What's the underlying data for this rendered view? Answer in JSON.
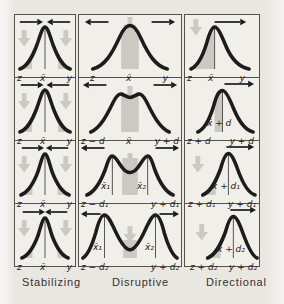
{
  "figure": {
    "title_hidden": "",
    "colors": {
      "curve": "#1c1c1c",
      "gray_region": "#cbc9c2",
      "background": "#e9e7e2",
      "panel_background": "#f1efea",
      "border": "#565349"
    },
    "columns": [
      {
        "caption": "Stabilizing",
        "rows": [
          {
            "left": "z",
            "mid": "x̄",
            "right": "y"
          },
          {
            "left": "z",
            "mid": "x̄",
            "right": "y"
          },
          {
            "left": "z",
            "mid": "x̄",
            "right": "y"
          },
          {
            "left": "z",
            "mid": "x̄",
            "right": "y"
          }
        ]
      },
      {
        "caption": "Disruptive",
        "rows": [
          {
            "left": "z",
            "mid": "x̄",
            "right": "y"
          },
          {
            "left": "z − d",
            "mid": "x̄",
            "right": "y + d"
          },
          {
            "left": "z − d₁",
            "right": "y + d₁",
            "peak1": "x̄₁",
            "peak2": "x̄₂"
          },
          {
            "left": "z − d₂",
            "right": "y + d₂",
            "peak1": "x̄₁",
            "peak2": "x̄₂"
          }
        ]
      },
      {
        "caption": "Directional",
        "rows": [
          {
            "left": "z",
            "mid": "x̄",
            "right": "y"
          },
          {
            "left": "z + d",
            "right": "y + d",
            "mean": "x̄ + d"
          },
          {
            "left": "z + d₁",
            "right": "y + d₁",
            "mean": "x̄ + d₁"
          },
          {
            "left": "z + d₂",
            "right": "y + d₂",
            "mean": "x̄ + d₂"
          }
        ]
      }
    ]
  }
}
